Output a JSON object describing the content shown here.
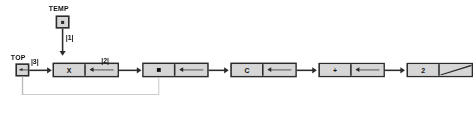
{
  "diagram": {
    "colors": {
      "cell_fill": "#d6d6d6",
      "border": "#2b2b2b",
      "feedback_line": "#b9b9b9",
      "background": "#ffffff"
    },
    "pointers": [
      {
        "id": "temp",
        "label": "TEMP",
        "glyph": "pointer-dot",
        "edge_label": "|1|",
        "points_to": "node-x"
      },
      {
        "id": "top",
        "label": "TOP",
        "glyph": "left-arrow",
        "edge_label": "|3|",
        "points_to": "node-x"
      }
    ],
    "edge_labels": {
      "temp_to_x": "|1|",
      "top_to_x": "|3|",
      "x_to_star": "|2|"
    },
    "nodes": [
      {
        "id": "node-x",
        "value": "X",
        "link": "left-arrow",
        "link_target": "node-star"
      },
      {
        "id": "node-star",
        "value": "*",
        "value_glyph": "dot",
        "link": "left-arrow",
        "link_target": "node-c"
      },
      {
        "id": "node-c",
        "value": "C",
        "link": "left-arrow",
        "link_target": "node-plus"
      },
      {
        "id": "node-plus",
        "value": "+",
        "link": "left-arrow",
        "link_target": "node-2"
      },
      {
        "id": "node-2",
        "value": "2",
        "link": "null-slash",
        "link_target": null
      }
    ],
    "feedback": {
      "from": "top",
      "to": "node-star",
      "style": "gray"
    }
  }
}
